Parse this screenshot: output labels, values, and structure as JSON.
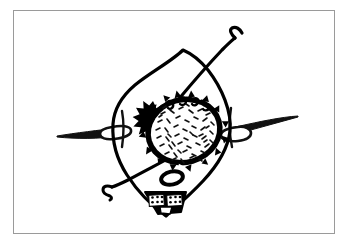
{
  "canvas": {
    "width": 353,
    "height": 249,
    "background_color": "#ffffff",
    "title": "Hand-drawn black ink line illustration"
  },
  "frame": {
    "name": "image-border-frame",
    "stroke_color": "#9a9a9a",
    "fill_color": "#ffffff",
    "x": 13,
    "y": 10,
    "width": 322,
    "height": 224,
    "stroke_width": 1
  },
  "drawing": {
    "style": "black ink hand-drawn line art",
    "ink_color": "#000000",
    "paper_color": "#ffffff",
    "elements": [
      {
        "id": "body-outline",
        "name": "leaf-shaped-body-outline",
        "description": "Large pointed leaf or eye shaped closed contour with a peak at the top and a point at the bottom",
        "stroke_color": "#000000",
        "stroke_width": 3
      },
      {
        "id": "nucleus-blob",
        "name": "textured-oval-nucleus",
        "description": "Tilted oval with thick spiky dark rim and short dash stipple texture inside",
        "stroke_color": "#000000",
        "fill_color": "#ffffff",
        "center_x": 184,
        "center_y": 131,
        "radius_x": 38,
        "radius_y": 33,
        "rotation_deg": -18,
        "dash_count": 78
      },
      {
        "id": "starburst",
        "name": "starburst-icon",
        "description": "Small solid black spiked star with a white center dot",
        "fill_color": "#000000",
        "center_x": 153,
        "center_y": 114,
        "outer_radius": 13,
        "inner_radius": 6,
        "points": 11
      },
      {
        "id": "needle-left",
        "name": "left-needle-shape",
        "description": "Long tapering needle with an elongated eye, entering the body from the left edge",
        "stroke_color": "#000000"
      },
      {
        "id": "needle-right",
        "name": "right-needle-shape",
        "description": "Long tapering needle with an elongated eye, entering the body from the right edge",
        "stroke_color": "#000000"
      },
      {
        "id": "hook-top-right",
        "name": "top-right-hooked-line",
        "description": "Diagonal line crossing the body and ending in a small crook hook at the upper right",
        "stroke_color": "#000000",
        "stroke_width": 3
      },
      {
        "id": "hook-bottom-left",
        "name": "bottom-left-hooked-line",
        "description": "Diagonal line crossing the body and ending in a small S crook at the lower left",
        "stroke_color": "#000000",
        "stroke_width": 3
      },
      {
        "id": "small-oval",
        "name": "small-oval-outline",
        "description": "Small thick outlined oval below the nucleus",
        "stroke_color": "#000000",
        "center_x": 172,
        "center_y": 178,
        "radius_x": 11,
        "radius_y": 6,
        "rotation_deg": -12
      },
      {
        "id": "dotted-trapezoid",
        "name": "dotted-trapezoid-cluster",
        "description": "Dark trapezoid band at the bottom containing two stippled white panels and a plain white notch",
        "fill_color": "#000000",
        "panel_count": 2,
        "dots_per_panel": 6
      }
    ]
  }
}
